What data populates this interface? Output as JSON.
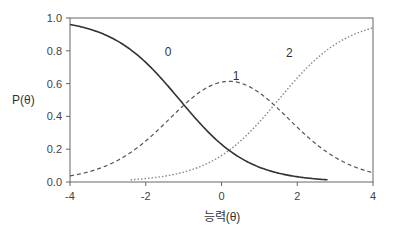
{
  "chart_data": {
    "type": "line",
    "title": "",
    "xlabel": "능력(θ)",
    "ylabel": "P(θ)",
    "xlim": [
      -4,
      4
    ],
    "ylim": [
      0.0,
      1.0
    ],
    "xticks": [
      -4,
      -2,
      0,
      2,
      4
    ],
    "xtick_labels": [
      "-4",
      "-2",
      "0",
      "2",
      "4"
    ],
    "yticks": [
      0.0,
      0.2,
      0.4,
      0.6,
      0.8,
      1.0
    ],
    "ytick_labels": [
      "0.0",
      "0.2",
      "0.4",
      "0.6",
      "0.8",
      "1.0"
    ],
    "grid": false,
    "legend": "none (curves labeled inline)",
    "model": {
      "a": 1.1,
      "b1": -1.1,
      "b2": 1.5
    },
    "series": [
      {
        "name": "0",
        "style": "solid",
        "x": [
          -4,
          -3,
          -2,
          -1,
          0,
          1,
          2,
          2.8
        ],
        "values": [
          0.96,
          0.91,
          0.73,
          0.47,
          0.23,
          0.09,
          0.03,
          0.01
        ]
      },
      {
        "name": "1",
        "style": "dashed",
        "x": [
          -4,
          -3,
          -2,
          -1,
          0,
          1,
          2,
          3,
          4
        ],
        "values": [
          0.04,
          0.11,
          0.27,
          0.48,
          0.57,
          0.44,
          0.34,
          0.16,
          0.05
        ]
      },
      {
        "name": "2",
        "style": "dotted",
        "x": [
          -2.4,
          -2,
          -1,
          0,
          1,
          2,
          3,
          4
        ],
        "values": [
          0.005,
          0.01,
          0.05,
          0.16,
          0.37,
          0.63,
          0.84,
          0.94
        ]
      }
    ],
    "annotations": [
      {
        "text": "0",
        "x": -1.5,
        "y": 0.77
      },
      {
        "text": "1",
        "x": 0.3,
        "y": 0.62
      },
      {
        "text": "2",
        "x": 1.7,
        "y": 0.76
      }
    ]
  },
  "labels": {
    "ylabel": "P(θ)",
    "xlabel": "능력(θ)",
    "curve0": "0",
    "curve1": "1",
    "curve2": "2"
  }
}
